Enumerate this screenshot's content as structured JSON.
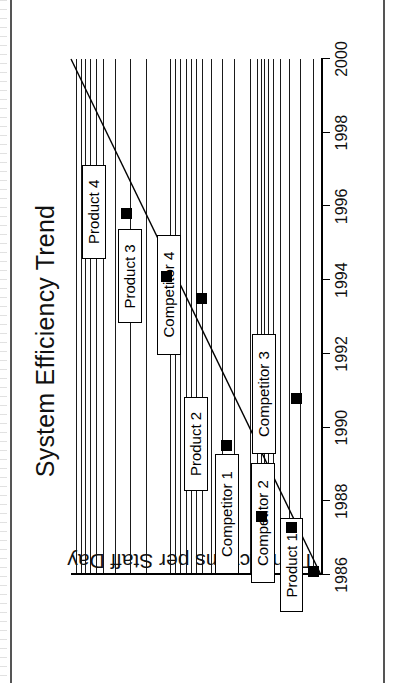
{
  "figure": {
    "title": "System Efficiency Trend",
    "y_axis_label": "Transactions per Staff Day"
  },
  "chart_data": {
    "type": "scatter",
    "title": "System Efficiency Trend",
    "xlabel": "",
    "ylabel": "Transactions per Staff Day",
    "xlim": [
      1986,
      2000
    ],
    "ylim": [
      0,
      100
    ],
    "grid": true,
    "legend": "none",
    "xticks": [
      "1986",
      "1988",
      "1990",
      "1992",
      "1994",
      "1996",
      "1998",
      "2000"
    ],
    "xtick_values": [
      1986,
      1988,
      1990,
      1992,
      1994,
      1996,
      1998,
      2000
    ],
    "yticks": [],
    "points": [
      {
        "label": "Product 1",
        "x": 1986.1,
        "y": 3
      },
      {
        "label": "Competitor 2",
        "x": 1987.3,
        "y": 12
      },
      {
        "label": "Competitor 1",
        "x": 1987.6,
        "y": 24
      },
      {
        "label": "Product 2",
        "x": 1989.5,
        "y": 38
      },
      {
        "label": "Competitor 3",
        "x": 1990.8,
        "y": 10
      },
      {
        "label": "Competitor 4",
        "x": 1993.5,
        "y": 48
      },
      {
        "label": "Product 3",
        "x": 1994.1,
        "y": 62
      },
      {
        "label": "Product 4",
        "x": 1995.8,
        "y": 78
      }
    ],
    "annotations": [
      {
        "text": "Product 1"
      },
      {
        "text": "Competitor 2"
      },
      {
        "text": "Competitor 1"
      },
      {
        "text": "Product 2"
      },
      {
        "text": "Competitor 3"
      },
      {
        "text": "Competitor 4"
      },
      {
        "text": "Product 3"
      },
      {
        "text": "Product 4"
      }
    ],
    "trend_line": {
      "name": "trend",
      "x0": 1986.0,
      "y0": 0,
      "x1": 2000.0,
      "y1": 100,
      "style": "solid"
    },
    "gridlines_y_fraction": [
      0.02,
      0.038,
      0.055,
      0.074,
      0.1,
      0.128,
      0.176,
      0.236,
      0.3,
      0.394,
      0.416,
      0.437,
      0.458,
      0.478,
      0.5,
      0.524,
      0.56,
      0.604,
      0.652,
      0.714,
      0.742,
      0.758,
      0.772,
      0.788,
      0.806,
      0.836,
      0.872,
      0.916,
      0.966
    ]
  }
}
